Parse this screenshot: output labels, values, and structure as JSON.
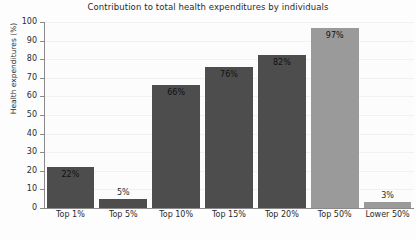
{
  "chart_data": {
    "type": "bar",
    "title": "Contribution to total health expenditures by individuals",
    "xlabel": "",
    "ylabel": "Health expenditures (%)",
    "ylim": [
      0,
      100
    ],
    "yticks": [
      0,
      10,
      20,
      30,
      40,
      50,
      60,
      70,
      80,
      90,
      100
    ],
    "ytick_labels": [
      "0",
      "10",
      "20",
      "30",
      "40",
      "50",
      "60",
      "70",
      "80",
      "90",
      "100"
    ],
    "grid": true,
    "legend": "none",
    "categories": [
      "Top 1%",
      "Top 5%",
      "Top 10%",
      "Top 15%",
      "Top 20%",
      "Top 50%",
      "Lower 50%"
    ],
    "values": [
      22,
      5,
      66,
      76,
      82,
      97,
      3
    ],
    "value_labels": [
      "22%",
      "5%",
      "66%",
      "76%",
      "82%",
      "97%",
      "3%"
    ],
    "label_placement": [
      "inside",
      "outside",
      "inside",
      "inside",
      "inside",
      "inside",
      "outside"
    ],
    "bar_colors": [
      "#4d4d4d",
      "#4d4d4d",
      "#4d4d4d",
      "#4d4d4d",
      "#4d4d4d",
      "#9a9a9a",
      "#9a9a9a"
    ],
    "colors": {
      "dark_bar": "#4d4d4d",
      "light_bar": "#9a9a9a",
      "axis": "#8a8a8a",
      "text": "#2b2b2b",
      "background": "#fdfdfd",
      "gridline": "#f1f1f0"
    }
  }
}
